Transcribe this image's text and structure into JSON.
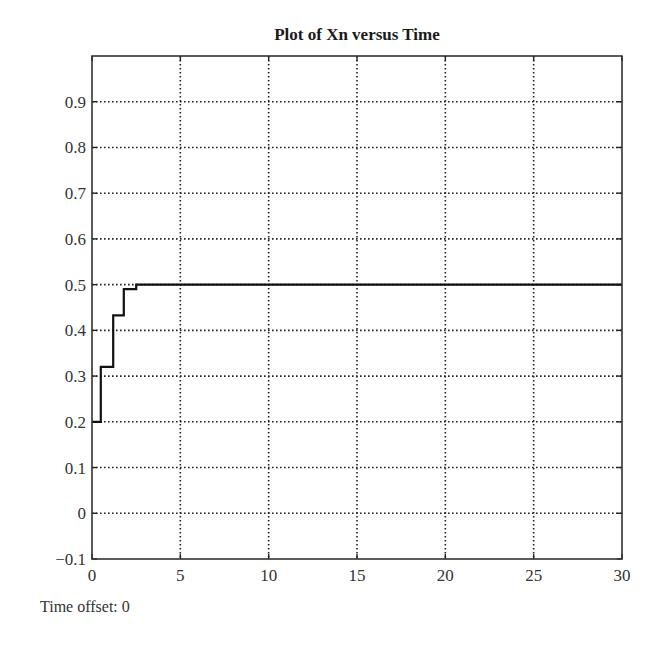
{
  "chart_data": {
    "type": "line",
    "title": "Plot of Xn versus Time",
    "xlabel": "",
    "ylabel": "",
    "xlim": [
      0,
      30
    ],
    "ylim": [
      -0.1,
      1.0
    ],
    "xticks": [
      0,
      5,
      10,
      15,
      20,
      25,
      30
    ],
    "xtick_labels": [
      "0",
      "5",
      "10",
      "15",
      "20",
      "25",
      "30"
    ],
    "yticks": [
      -0.1,
      0,
      0.1,
      0.2,
      0.3,
      0.4,
      0.5,
      0.6,
      0.7,
      0.8,
      0.9
    ],
    "ytick_labels": [
      "−0.1",
      "0",
      "0.1",
      "0.2",
      "0.3",
      "0.4",
      "0.5",
      "0.6",
      "0.7",
      "0.8",
      "0.9"
    ],
    "grid": true,
    "grid_style": "dotted",
    "legend": null,
    "line_style": "step",
    "series": [
      {
        "name": "Xn",
        "color": "#111111",
        "x": [
          0,
          0.5,
          0.5,
          1.2,
          1.2,
          1.8,
          1.8,
          2.5,
          2.5,
          30
        ],
        "y": [
          0.2,
          0.2,
          0.32,
          0.32,
          0.433,
          0.433,
          0.49,
          0.49,
          0.5,
          0.5
        ]
      }
    ]
  },
  "footer": {
    "time_offset_label": "Time offset: 0"
  }
}
